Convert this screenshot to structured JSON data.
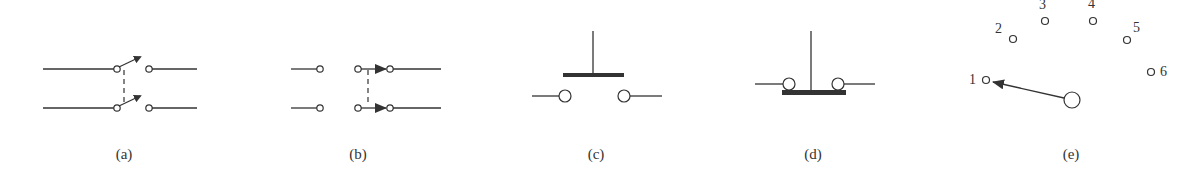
{
  "figure": {
    "panels": [
      {
        "id": "a",
        "label": "(a)",
        "description": "double-pole single-throw switch (ganged)"
      },
      {
        "id": "b",
        "label": "(b)",
        "description": "double-pole switch, sliding contacts"
      },
      {
        "id": "c",
        "label": "(c)",
        "description": "push-button, normally open"
      },
      {
        "id": "d",
        "label": "(d)",
        "description": "push-button, normally closed"
      },
      {
        "id": "e",
        "label": "(e)",
        "description": "rotary multi-position switch"
      }
    ],
    "rotary_positions": [
      "1",
      "2",
      "3",
      "4",
      "5",
      "6"
    ],
    "rotary_selected": "1"
  }
}
